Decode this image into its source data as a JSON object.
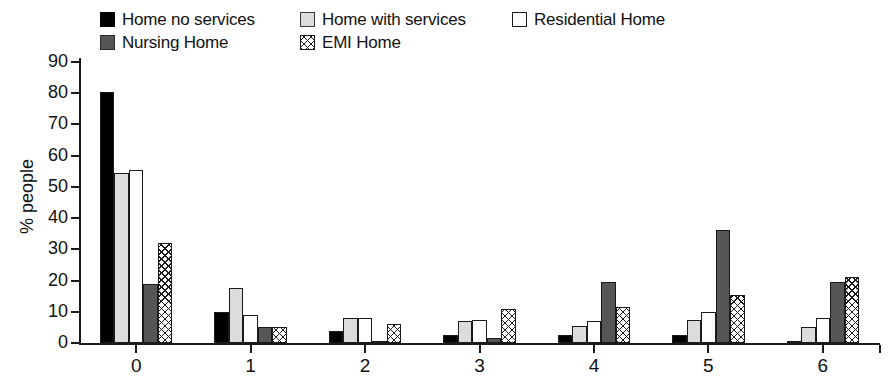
{
  "chart_data": {
    "type": "bar",
    "title": "",
    "xlabel": "",
    "ylabel": "% people",
    "categories": [
      "0",
      "1",
      "2",
      "3",
      "4",
      "5",
      "6"
    ],
    "ylim": [
      0,
      90
    ],
    "yticks": [
      0,
      10,
      20,
      30,
      40,
      50,
      60,
      70,
      80,
      90
    ],
    "grid": false,
    "legend_position": "top",
    "series": [
      {
        "name": "Home no services",
        "fill": "solid-black",
        "color": "#000000",
        "values": [
          80.5,
          10,
          4,
          2.5,
          2.5,
          2.5,
          0.3
        ]
      },
      {
        "name": "Home with services",
        "fill": "solid-light-gray",
        "color": "#dcdcdc",
        "values": [
          54.5,
          17.5,
          8,
          7,
          5.5,
          7.5,
          5
        ]
      },
      {
        "name": "Residential Home",
        "fill": "solid-white",
        "color": "#ffffff",
        "values": [
          55.5,
          9,
          8,
          7.5,
          7,
          10,
          8
        ]
      },
      {
        "name": "Nursing Home",
        "fill": "solid-dark-gray",
        "color": "#565656",
        "values": [
          19,
          5,
          0.6,
          1.5,
          19.5,
          36.2,
          19.5
        ]
      },
      {
        "name": "EMI Home",
        "fill": "cross-hatch",
        "color": "#ffffff",
        "values": [
          32,
          5,
          6,
          11,
          11.5,
          15.5,
          21
        ]
      }
    ]
  },
  "legend": {
    "rows": [
      [
        {
          "label": "Home no services",
          "swatch": "fill-black"
        },
        {
          "label": "Home with services",
          "swatch": "fill-lightgray"
        },
        {
          "label": "Residential Home",
          "swatch": "fill-white"
        }
      ],
      [
        {
          "label": "Nursing Home",
          "swatch": "fill-darkgray"
        },
        {
          "label": "EMI Home",
          "swatch": "fill-hatch"
        }
      ]
    ]
  }
}
